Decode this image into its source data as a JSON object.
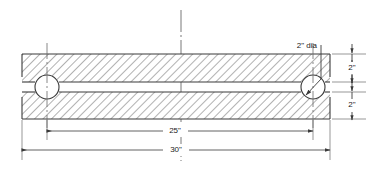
{
  "drawing": {
    "title": "Two plates with bolt holes - sectional elevation",
    "units": "inches",
    "background_color": "#ffffff",
    "line_color": "#3a3a3a",
    "text_color": "#1a1a1a",
    "hatch_color": "#8a8a8a",
    "annotations": {
      "hole_diameter_note": "2\" dia",
      "overall_length": "30\"",
      "hole_spacing": "25\"",
      "top_plate_thickness": "2\"",
      "bottom_plate_thickness": "2\""
    },
    "geometry": {
      "plate_left_x": 22,
      "plate_right_x": 330,
      "top_plate_top_y": 54,
      "top_plate_bottom_y": 82,
      "bottom_plate_top_y": 92,
      "bottom_plate_bottom_y": 119,
      "left_hole_center_x": 47,
      "right_hole_center_x": 313,
      "hole_center_y": 87,
      "hole_radius": 12,
      "center_line_x": 181,
      "dim_25_y": 131,
      "dim_30_y": 150,
      "right_dim_x": 352
    }
  }
}
